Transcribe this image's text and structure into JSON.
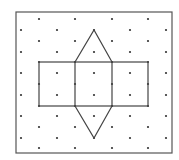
{
  "figure": {
    "frame": {
      "x": 16,
      "y": 12,
      "width": 156,
      "height": 141,
      "stroke": "#555555"
    },
    "grid": {
      "odd_columns_x": [
        21,
        57,
        94,
        130,
        166
      ],
      "odd_rows_y": [
        30,
        52,
        73,
        95,
        116,
        138
      ],
      "even_columns_x": [
        39,
        75,
        112,
        148
      ],
      "even_rows_y": [
        19,
        41,
        62,
        84,
        106,
        127,
        148
      ],
      "dot_color": "#333333",
      "dot_radius": 1.1
    },
    "net": {
      "stroke": "#444444",
      "rectangle": {
        "x1": 39,
        "y1": 62,
        "x2": 148,
        "y2": 106
      },
      "inner_verticals_x": [
        75,
        112
      ],
      "top_triangle": [
        [
          75,
          62
        ],
        [
          94,
          30
        ],
        [
          112,
          62
        ]
      ],
      "bottom_triangle": [
        [
          75,
          106
        ],
        [
          94,
          138
        ],
        [
          112,
          106
        ]
      ]
    }
  }
}
